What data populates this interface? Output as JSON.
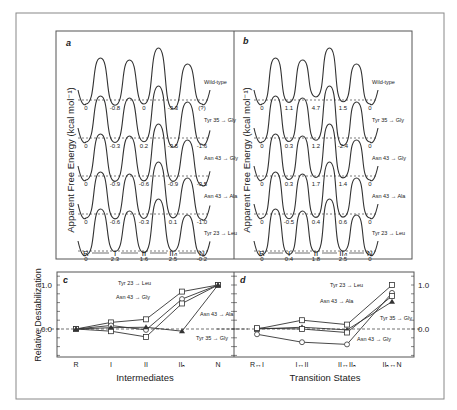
{
  "figure": {
    "panels": {
      "a": {
        "label": "a",
        "ylabel": "Apparent Free Energy (kcal mol⁻¹)",
        "b_marker": "b",
        "states": [
          "R",
          "I",
          "II",
          "IIₙ",
          "N"
        ],
        "rows": [
          {
            "name": "Wild-type",
            "values": [
              "0",
              "-0.8",
              "0",
              "-3.3",
              "(?)"
            ]
          },
          {
            "name": "Tyr 35 → Gly",
            "values": [
              "0",
              "-0.3",
              "0.2",
              "-3.5",
              "-1.6"
            ]
          },
          {
            "name": "Asn 43 → Gly",
            "values": [
              "0",
              "-0.9",
              "-0.6",
              "-0.9",
              "-3.5"
            ]
          },
          {
            "name": "Asn 43 → Ala",
            "values": [
              "0",
              "-0.6",
              "-0.3",
              "0.1",
              "-1.0"
            ]
          },
          {
            "name": "Tyr 23 → Leu",
            "values": [
              "0",
              "2.3",
              "1.6",
              "2.5",
              "-0.2"
            ]
          }
        ]
      },
      "b": {
        "label": "b",
        "ylabel": "Apparent Free Energy (kcal mol⁻¹)",
        "b_marker": "b",
        "states": [
          "R",
          "I",
          "II",
          "IIₙ",
          "N"
        ],
        "rows": [
          {
            "name": "Wild-type",
            "values": [
              "0",
              "1.1",
              "4.7",
              "1.5",
              "0"
            ]
          },
          {
            "name": "Tyr 35 → Gly",
            "values": [
              "0",
              "0.3",
              "1.2",
              "-2.4",
              "0"
            ]
          },
          {
            "name": "Asn 43 → Gly",
            "values": [
              "0",
              "0.3",
              "1.7",
              "1.4",
              "0"
            ]
          },
          {
            "name": "Asn 43 → Ala",
            "values": [
              "0",
              "-0.5",
              "0.4",
              "0.6",
              "0"
            ]
          },
          {
            "name": "Tyr 23 → Leu",
            "values": [
              "0",
              "0.4",
              "1.8",
              "2.5",
              "0"
            ]
          }
        ]
      },
      "c": {
        "label": "c",
        "ylabel": "Relative Destabilization",
        "xlabel": "Intermediates",
        "yticks": [
          "1.0",
          "0.0"
        ]
      },
      "d": {
        "label": "d",
        "xlabel": "Transition States",
        "yticks": [
          "1.0",
          "0.0"
        ]
      }
    }
  },
  "chart_data": [
    {
      "type": "line",
      "panel": "c",
      "title": "",
      "xlabel": "Intermediates",
      "ylabel": "Relative Destabilization",
      "categories": [
        "R",
        "I",
        "II",
        "IIₙ",
        "N"
      ],
      "ylim": [
        -0.65,
        1.3
      ],
      "series": [
        {
          "name": "Tyr 23 → Leu",
          "marker": "square",
          "values": [
            0.0,
            0.15,
            0.22,
            0.85,
            1.0
          ]
        },
        {
          "name": "Asn 43 → Gly",
          "marker": "circle",
          "values": [
            0.0,
            0.08,
            -0.02,
            0.68,
            1.0
          ]
        },
        {
          "name": "Asn 43 → Ala",
          "marker": "square",
          "values": [
            0.0,
            -0.05,
            -0.18,
            0.58,
            1.0
          ]
        },
        {
          "name": "Tyr 35 → Gly",
          "marker": "triangle",
          "values": [
            0.0,
            0.03,
            0.04,
            -0.05,
            1.0
          ]
        }
      ],
      "reference_line": 0.0
    },
    {
      "type": "line",
      "panel": "d",
      "title": "",
      "xlabel": "Transition States",
      "ylabel": "",
      "categories": [
        "R↔I",
        "I↔II",
        "II↔IIₙ",
        "IIₙ↔N"
      ],
      "ylim": [
        -0.65,
        1.3
      ],
      "series": [
        {
          "name": "Tyr 23 → Leu",
          "marker": "square",
          "values": [
            0.0,
            0.2,
            0.1,
            1.0
          ]
        },
        {
          "name": "Asn 43 → Ala",
          "marker": "circle",
          "values": [
            -0.12,
            -0.3,
            -0.35,
            0.82
          ]
        },
        {
          "name": "Tyr 35 → Gly",
          "marker": "triangle",
          "values": [
            0.0,
            0.04,
            -0.02,
            0.62
          ]
        },
        {
          "name": "Asn 43 → Gly",
          "marker": "square",
          "values": [
            0.02,
            0.0,
            -0.08,
            0.75
          ]
        }
      ],
      "reference_line": 0.0
    }
  ]
}
